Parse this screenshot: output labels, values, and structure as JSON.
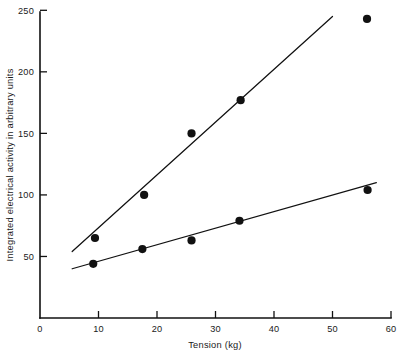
{
  "chart_data": {
    "type": "scatter",
    "title": "",
    "xlabel": "Tension (kg)",
    "ylabel": "Integrated electrical activity in arbitrary units",
    "xlim": [
      0,
      60
    ],
    "ylim": [
      0,
      250
    ],
    "xticks": [
      0,
      10,
      20,
      30,
      40,
      50,
      60
    ],
    "xticklabels": [
      "0",
      "10",
      "20",
      "30",
      "40",
      "50",
      "60"
    ],
    "yticks": [
      50,
      100,
      150,
      200,
      250
    ],
    "yticklabels": [
      "50",
      "100",
      "150",
      "200",
      "250"
    ],
    "grid": false,
    "legend": "none",
    "marker": "filled-circle",
    "marker_color": "#111111",
    "line_color": "#111111",
    "series": [
      {
        "name": "upper",
        "points": [
          {
            "x": 9.4,
            "y": 65
          },
          {
            "x": 17.8,
            "y": 100
          },
          {
            "x": 25.9,
            "y": 150
          },
          {
            "x": 34.3,
            "y": 177
          },
          {
            "x": 55.9,
            "y": 243
          }
        ],
        "fit_line": {
          "x1": 5.5,
          "y1": 54,
          "x2": 50.0,
          "y2": 245
        }
      },
      {
        "name": "lower",
        "points": [
          {
            "x": 9.1,
            "y": 44
          },
          {
            "x": 17.5,
            "y": 56
          },
          {
            "x": 25.9,
            "y": 63
          },
          {
            "x": 34.1,
            "y": 79
          },
          {
            "x": 56.0,
            "y": 104
          }
        ],
        "fit_line": {
          "x1": 5.5,
          "y1": 40,
          "x2": 57.5,
          "y2": 110
        }
      }
    ]
  },
  "axes": {
    "x_axis_name": "tension-axis",
    "y_axis_name": "activity-axis"
  }
}
